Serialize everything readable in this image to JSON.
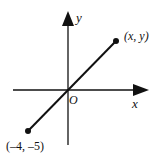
{
  "diagram": {
    "type": "coordinate-plane-line-segment",
    "axes": {
      "x_label": "x",
      "y_label": "y",
      "origin_label": "O"
    },
    "points": [
      {
        "label": "(x, y)",
        "role": "endpoint-upper-right"
      },
      {
        "label": "(–4, –5)",
        "role": "endpoint-lower-left"
      }
    ],
    "colors": {
      "stroke": "#111111",
      "background": "#ffffff"
    }
  }
}
